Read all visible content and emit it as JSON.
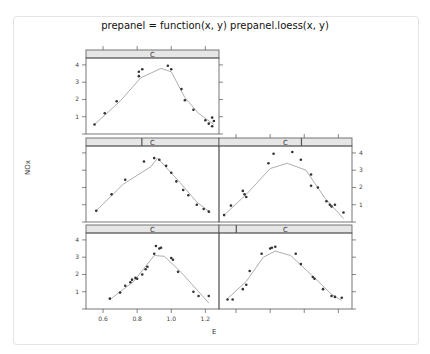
{
  "title": "prepanel = function(x, y) prepanel.loess(x, y)",
  "chart_data": {
    "type": "scatter",
    "title": "prepanel = function(x, y) prepanel.loess(x, y)",
    "xlabel": "E",
    "ylabel": "NOx",
    "layout": "2 columns x 3 rows, conditioning shingle C, loess smooth line",
    "x_ticks": [
      "0.6",
      "0.8",
      "1.0",
      "1.2"
    ],
    "y_ticks": [
      "1",
      "2",
      "3",
      "4"
    ],
    "xlim": [
      0.5,
      1.28
    ],
    "ylim": [
      0,
      4.4
    ],
    "panels": [
      {
        "strip": "C",
        "position": "top-left",
        "points": [
          [
            0.55,
            0.55
          ],
          [
            0.61,
            1.2
          ],
          [
            0.68,
            1.9
          ],
          [
            0.81,
            3.35
          ],
          [
            0.81,
            3.6
          ],
          [
            0.83,
            3.75
          ],
          [
            0.98,
            3.95
          ],
          [
            1.0,
            3.75
          ],
          [
            1.06,
            2.6
          ],
          [
            1.08,
            1.95
          ],
          [
            1.13,
            1.4
          ],
          [
            1.2,
            0.8
          ],
          [
            1.22,
            0.6
          ],
          [
            1.24,
            0.95
          ],
          [
            1.24,
            0.45
          ],
          [
            1.25,
            0.75
          ]
        ],
        "smooth": [
          [
            0.55,
            0.55
          ],
          [
            0.7,
            1.9
          ],
          [
            0.82,
            3.25
          ],
          [
            0.94,
            3.8
          ],
          [
            1.0,
            3.6
          ],
          [
            1.08,
            2.1
          ],
          [
            1.16,
            1.2
          ],
          [
            1.25,
            0.55
          ]
        ]
      },
      {
        "strip": "C",
        "position": "middle-left",
        "points": [
          [
            0.56,
            0.65
          ],
          [
            0.65,
            1.6
          ],
          [
            0.73,
            2.45
          ],
          [
            0.84,
            3.5
          ],
          [
            0.9,
            3.7
          ],
          [
            0.93,
            3.6
          ],
          [
            0.97,
            3.25
          ],
          [
            1.0,
            2.85
          ],
          [
            1.03,
            2.35
          ],
          [
            1.07,
            1.85
          ],
          [
            1.1,
            1.55
          ],
          [
            1.15,
            1.0
          ],
          [
            1.19,
            0.75
          ],
          [
            1.22,
            0.6
          ]
        ],
        "smooth": [
          [
            0.56,
            0.65
          ],
          [
            0.72,
            2.2
          ],
          [
            0.88,
            3.2
          ],
          [
            0.92,
            3.7
          ],
          [
            1.05,
            2.3
          ],
          [
            1.15,
            1.15
          ],
          [
            1.23,
            0.55
          ]
        ]
      },
      {
        "strip": "C",
        "position": "middle-right",
        "points": [
          [
            0.53,
            0.4
          ],
          [
            0.57,
            0.95
          ],
          [
            0.64,
            1.8
          ],
          [
            0.65,
            1.6
          ],
          [
            0.66,
            1.45
          ],
          [
            0.79,
            3.4
          ],
          [
            0.82,
            3.95
          ],
          [
            0.93,
            4.05
          ],
          [
            0.98,
            3.6
          ],
          [
            1.04,
            2.75
          ],
          [
            1.04,
            2.1
          ],
          [
            1.08,
            2.0
          ],
          [
            1.13,
            1.2
          ],
          [
            1.15,
            1.0
          ],
          [
            1.16,
            0.9
          ],
          [
            1.18,
            1.0
          ],
          [
            1.23,
            0.55
          ]
        ],
        "smooth": [
          [
            0.53,
            0.4
          ],
          [
            0.66,
            1.6
          ],
          [
            0.8,
            3.1
          ],
          [
            0.9,
            3.4
          ],
          [
            1.01,
            3.0
          ],
          [
            1.12,
            1.4
          ],
          [
            1.23,
            0.2
          ]
        ]
      },
      {
        "strip": "C",
        "position": "bottom-left",
        "points": [
          [
            0.64,
            0.6
          ],
          [
            0.7,
            0.95
          ],
          [
            0.73,
            1.35
          ],
          [
            0.76,
            1.55
          ],
          [
            0.77,
            1.7
          ],
          [
            0.79,
            1.8
          ],
          [
            0.8,
            1.75
          ],
          [
            0.83,
            2.0
          ],
          [
            0.85,
            2.3
          ],
          [
            0.86,
            2.45
          ],
          [
            0.9,
            3.2
          ],
          [
            0.91,
            3.65
          ],
          [
            0.93,
            3.5
          ],
          [
            0.94,
            3.55
          ],
          [
            1.0,
            2.95
          ],
          [
            1.01,
            2.85
          ],
          [
            1.04,
            2.15
          ],
          [
            1.13,
            1.0
          ],
          [
            1.16,
            0.75
          ],
          [
            1.22,
            0.75
          ]
        ],
        "smooth": [
          [
            0.64,
            0.55
          ],
          [
            0.78,
            1.6
          ],
          [
            0.9,
            3.1
          ],
          [
            0.96,
            3.05
          ],
          [
            1.06,
            2.1
          ],
          [
            1.22,
            0.35
          ]
        ]
      },
      {
        "strip": "C",
        "position": "bottom-right",
        "points": [
          [
            0.55,
            0.55
          ],
          [
            0.58,
            0.55
          ],
          [
            0.64,
            1.15
          ],
          [
            0.66,
            1.4
          ],
          [
            0.68,
            2.2
          ],
          [
            0.75,
            3.2
          ],
          [
            0.8,
            3.5
          ],
          [
            0.81,
            3.55
          ],
          [
            0.83,
            3.6
          ],
          [
            0.95,
            3.2
          ],
          [
            0.98,
            2.6
          ],
          [
            1.05,
            1.85
          ],
          [
            1.06,
            1.75
          ],
          [
            1.11,
            1.15
          ],
          [
            1.16,
            0.75
          ],
          [
            1.18,
            0.7
          ],
          [
            1.22,
            0.65
          ]
        ],
        "smooth": [
          [
            0.55,
            0.6
          ],
          [
            0.66,
            1.6
          ],
          [
            0.76,
            3.0
          ],
          [
            0.83,
            3.35
          ],
          [
            0.92,
            3.1
          ],
          [
            1.05,
            1.9
          ],
          [
            1.16,
            0.85
          ],
          [
            1.22,
            0.5
          ]
        ]
      }
    ],
    "grid": false,
    "legend": "none"
  }
}
